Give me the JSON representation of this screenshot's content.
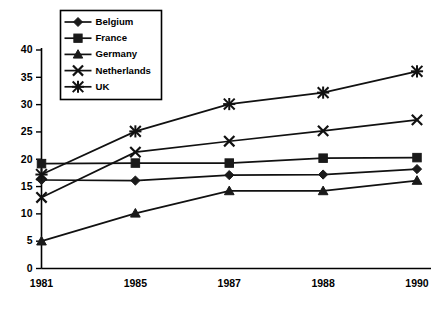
{
  "chart_data": {
    "type": "line",
    "title": "",
    "subtitle": "",
    "xlabel": "",
    "ylabel": "",
    "categories": [
      "1981",
      "1985",
      "1987",
      "1988",
      "1990"
    ],
    "x": [
      1981,
      1985,
      1987,
      1988,
      1990
    ],
    "ylim": [
      0,
      40
    ],
    "yticks": [
      0,
      5,
      10,
      15,
      20,
      25,
      30,
      35,
      40
    ],
    "ytick_labels": [
      "0",
      "5",
      "10",
      "15",
      "20",
      "25",
      "30",
      "35",
      "40"
    ],
    "grid": false,
    "legend_position": "top-left-inside",
    "series": [
      {
        "name": "Belgium",
        "marker": "diamond",
        "values": [
          16.2,
          16.1,
          17.1,
          17.2,
          18.2
        ]
      },
      {
        "name": "France",
        "marker": "square",
        "values": [
          19.2,
          19.3,
          19.3,
          20.2,
          20.3
        ]
      },
      {
        "name": "Germany",
        "marker": "triangle",
        "values": [
          5.0,
          10.1,
          14.2,
          14.2,
          16.1
        ]
      },
      {
        "name": "Netherlands",
        "marker": "cross",
        "values": [
          13.0,
          21.3,
          23.3,
          25.2,
          27.2
        ]
      },
      {
        "name": "UK",
        "marker": "star",
        "values": [
          17.2,
          25.1,
          30.1,
          32.2,
          36.1
        ]
      }
    ],
    "colors": {
      "line": "#111111",
      "marker": "#1a1a1a",
      "axis": "#000000",
      "background": "#ffffff"
    }
  },
  "legend": {
    "items": [
      {
        "label": "Belgium"
      },
      {
        "label": "France"
      },
      {
        "label": "Germany"
      },
      {
        "label": "Netherlands"
      },
      {
        "label": "UK"
      }
    ]
  },
  "axes": {
    "y_tick_labels": [
      "40",
      "35",
      "30",
      "25",
      "20",
      "15",
      "10",
      "5",
      "0"
    ],
    "x_tick_labels": [
      "1981",
      "1985",
      "1987",
      "1988",
      "1990"
    ]
  }
}
